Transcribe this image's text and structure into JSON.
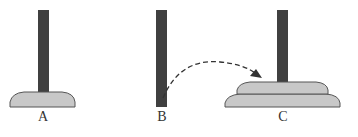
{
  "diagram": {
    "colors": {
      "peg": "#404040",
      "disk_fill": "#c8c8c8",
      "disk_stroke": "#555555",
      "arrow": "#333333",
      "label": "#333333",
      "background": "#ffffff"
    },
    "pegs": [
      {
        "id": "A",
        "label": "A",
        "disks": 1
      },
      {
        "id": "B",
        "label": "B",
        "disks": 0
      },
      {
        "id": "C",
        "label": "C",
        "disks": 2
      }
    ],
    "arrow": {
      "from": "B",
      "to": "C",
      "style": "dashed"
    }
  }
}
